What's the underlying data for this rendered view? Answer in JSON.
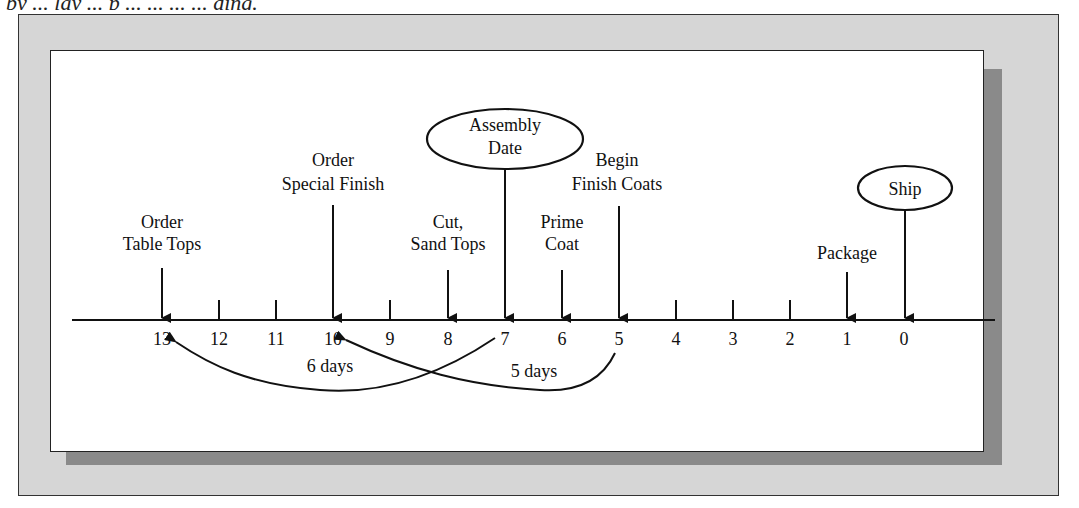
{
  "caption": {
    "text": "by ... lay ... p ... ... ... ... ding."
  },
  "diagram": {
    "axis_ticks": [
      "13",
      "12",
      "11",
      "10",
      "9",
      "8",
      "7",
      "6",
      "5",
      "4",
      "3",
      "2",
      "1",
      "0"
    ],
    "events": [
      {
        "id": "order-table-tops",
        "line1": "Order",
        "line2": "Table Tops",
        "day": 13
      },
      {
        "id": "order-special-finish",
        "line1": "Order",
        "line2": "Special Finish",
        "day": 10
      },
      {
        "id": "cut-sand-tops",
        "line1": "Cut,",
        "line2": "Sand Tops",
        "day": 8
      },
      {
        "id": "assembly-date",
        "line1": "Assembly",
        "line2": "Date",
        "day": 7,
        "milestone": true
      },
      {
        "id": "prime-coat",
        "line1": "Prime",
        "line2": "Coat",
        "day": 6
      },
      {
        "id": "begin-finish-coats",
        "line1": "Begin",
        "line2": "Finish Coats",
        "day": 5
      },
      {
        "id": "package",
        "line1": "Package",
        "line2": "",
        "day": 1
      },
      {
        "id": "ship",
        "line1": "Ship",
        "line2": "",
        "day": 0,
        "milestone": true
      }
    ],
    "lead_times": [
      {
        "label": "6 days",
        "from_day": 7,
        "to_day": 13
      },
      {
        "label": "5 days",
        "from_day": 5,
        "to_day": 10
      }
    ]
  },
  "colors": {
    "outer_frame": "#d6d6d6",
    "shadow": "#8a8a8a",
    "panel": "#ffffff",
    "ink": "#111111"
  }
}
